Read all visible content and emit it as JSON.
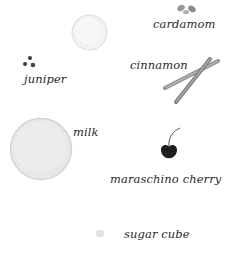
{
  "ingredients": [
    {
      "label": "cardamom",
      "icon": "cardamom-pods-icon"
    },
    {
      "label": "juniper",
      "icon": "juniper-berries-icon"
    },
    {
      "label": "cinnamon",
      "icon": "cinnamon-sticks-icon"
    },
    {
      "label": "milk",
      "icon": "milk-disc-icon"
    },
    {
      "label": "maraschino cherry",
      "icon": "cherry-icon"
    },
    {
      "label": "sugar cube",
      "icon": "sugar-cube-icon"
    }
  ],
  "extra_icons": [
    {
      "icon": "ice-disc-icon"
    }
  ],
  "colors": {
    "label": "#2a2a2a",
    "cherry": "#1e1e1e",
    "cinnamon": "#8a8a8a",
    "milk": "#e6e6e6",
    "ice": "#f0f0f0"
  }
}
